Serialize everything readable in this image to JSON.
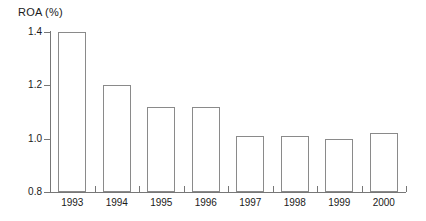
{
  "chart_data": {
    "type": "bar",
    "title": "ROA (%)",
    "xlabel": "",
    "ylabel": "ROA (%)",
    "categories": [
      "1993",
      "1994",
      "1995",
      "1996",
      "1997",
      "1998",
      "1999",
      "2000"
    ],
    "values": [
      1.4,
      1.2,
      1.12,
      1.12,
      1.01,
      1.01,
      1.0,
      1.02
    ],
    "ylim": [
      0.8,
      1.4
    ],
    "yticks": [
      "0.8",
      "1.0",
      "1.2",
      "1.4"
    ],
    "ytick_values": [
      0.8,
      1.0,
      1.2,
      1.4
    ],
    "grid": false,
    "legend": false,
    "bar_fill": "#ffffff",
    "bar_outline": "#8a8a8a",
    "axis_color": "#777777",
    "background": "#ffffff"
  }
}
